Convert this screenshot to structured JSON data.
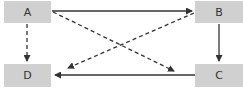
{
  "diagram": {
    "nodes": [
      {
        "id": "A",
        "label": "A"
      },
      {
        "id": "B",
        "label": "B"
      },
      {
        "id": "C",
        "label": "C"
      },
      {
        "id": "D",
        "label": "D"
      }
    ],
    "edges": [
      {
        "from": "A",
        "to": "B",
        "style": "solid"
      },
      {
        "from": "B",
        "to": "C",
        "style": "solid"
      },
      {
        "from": "C",
        "to": "D",
        "style": "solid"
      },
      {
        "from": "A",
        "to": "D",
        "style": "dashed"
      },
      {
        "from": "A",
        "to": "C",
        "style": "dashed"
      },
      {
        "from": "B",
        "to": "D",
        "style": "dashed"
      }
    ],
    "colors": {
      "node_fill": "#d0d0d0",
      "edge": "#333333"
    }
  }
}
